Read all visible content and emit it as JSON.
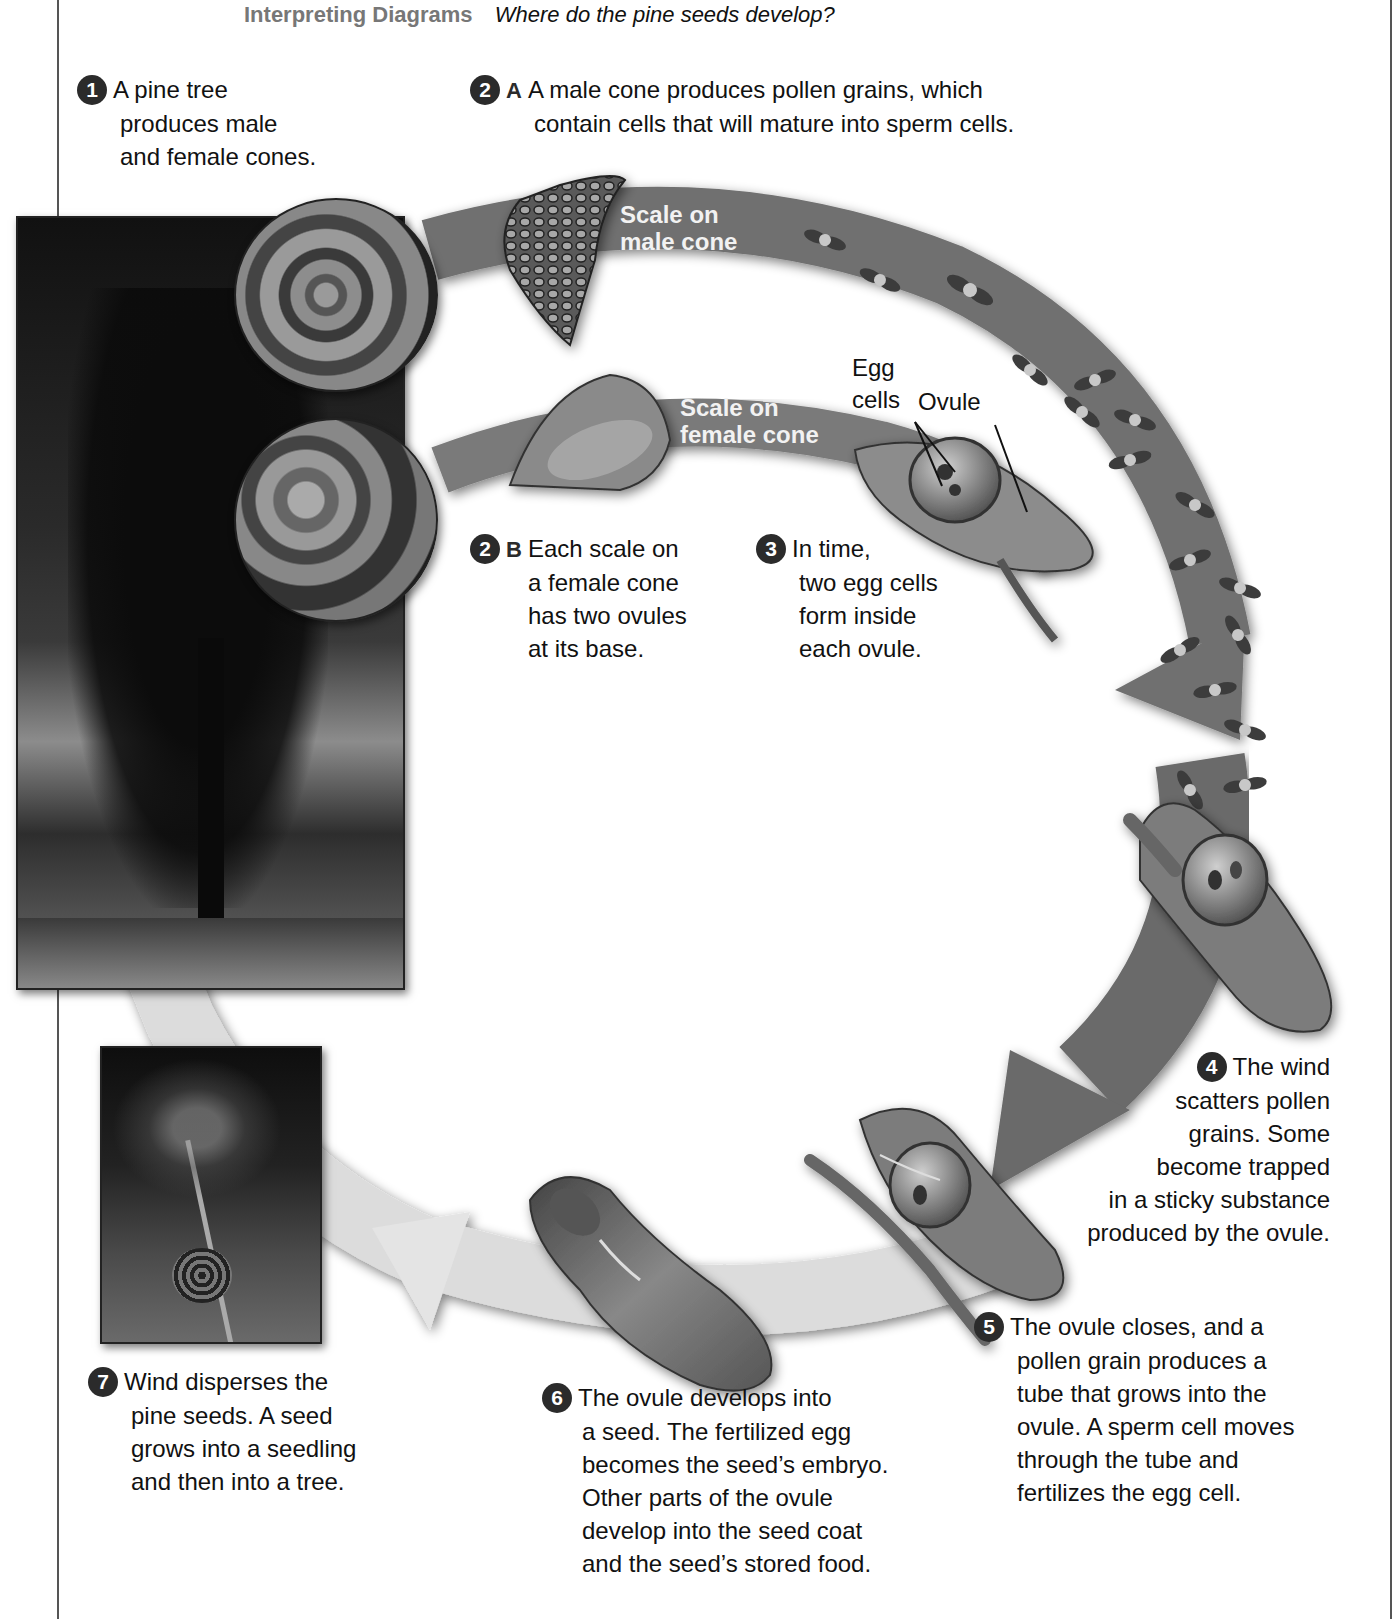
{
  "header": {
    "skill_label": "Interpreting Diagrams",
    "question": "Where do the pine seeds develop?"
  },
  "steps": [
    {
      "number": "1",
      "letter": "",
      "lines": [
        "A pine tree",
        "produces male",
        "and female cones."
      ]
    },
    {
      "number": "2",
      "letter": "A",
      "lines": [
        "A male cone produces pollen grains, which",
        "contain cells that will mature into sperm cells."
      ]
    },
    {
      "number": "2",
      "letter": "B",
      "lines": [
        "Each scale on",
        "a female cone",
        "has two ovules",
        "at its base."
      ]
    },
    {
      "number": "3",
      "letter": "",
      "lines": [
        "In time,",
        "two egg cells",
        "form inside",
        "each ovule."
      ]
    },
    {
      "number": "4",
      "letter": "",
      "lines": [
        "The wind",
        "scatters pollen",
        "grains. Some",
        "become trapped",
        "in a sticky substance",
        "produced by the ovule."
      ]
    },
    {
      "number": "5",
      "letter": "",
      "lines": [
        "The ovule closes, and a",
        "pollen grain produces a",
        "tube that grows into the",
        "ovule. A sperm cell moves",
        "through the tube and",
        "fertilizes the egg cell."
      ]
    },
    {
      "number": "6",
      "letter": "",
      "lines": [
        "The ovule develops into",
        "a seed. The fertilized egg",
        "becomes the seed’s embryo.",
        "Other parts of the ovule",
        "develop into the seed coat",
        "and the seed’s stored food."
      ]
    },
    {
      "number": "7",
      "letter": "",
      "lines": [
        "Wind disperses the",
        "pine seeds. A seed",
        "grows into a seedling",
        "and then into a tree."
      ]
    }
  ],
  "labels": {
    "male_scale": [
      "Scale on",
      "male cone"
    ],
    "female_scale": [
      "Scale on",
      "female cone"
    ],
    "egg_cells": [
      "Egg",
      "cells"
    ],
    "ovule": "Ovule"
  },
  "images": {
    "tree_photo": "pine-tree-photo",
    "male_cone_photo": "male-cones-photo",
    "female_cone_photo": "female-cones-photo",
    "seedling_photo": "pine-seedling-photo"
  },
  "colors": {
    "frame": "#555555",
    "dark_arrow": "#6e6e6e",
    "light_arrow": "#d9d9d9",
    "badge": "#2b2b2b",
    "skill_label": "#777777"
  }
}
